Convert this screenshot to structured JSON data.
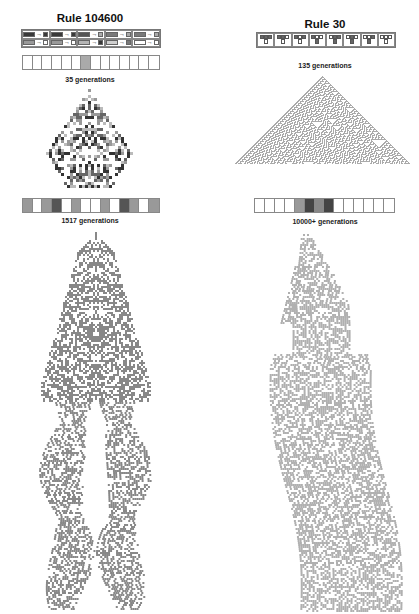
{
  "figure": {
    "left": {
      "title": "Rule 104600",
      "rule_icons": [
        {
          "input": "#3a3a3a",
          "output": "#3a3a3a"
        },
        {
          "input": "#3a3a3a",
          "output": "#3a3a3a"
        },
        {
          "input": "#555555",
          "output": "#aaaaaa"
        },
        {
          "input": "#7a7a7a",
          "output": "#aaaaaa"
        },
        {
          "input": "#7a7a7a",
          "output": "#aaaaaa"
        },
        {
          "input": "#999999",
          "output": "#ffffff"
        },
        {
          "input": "#999999",
          "output": "#ffffff"
        },
        {
          "input": "#b5b5b5",
          "output": "#3a3a3a"
        },
        {
          "input": "#d0d0d0",
          "output": "#7a7a7a"
        },
        {
          "input": "#ffffff",
          "output": "#ffffff"
        }
      ],
      "initial_state_1": [
        "#fff",
        "#fff",
        "#fff",
        "#fff",
        "#fff",
        "#fff",
        "#aaa",
        "#fff",
        "#fff",
        "#fff",
        "#fff",
        "#fff",
        "#fff",
        "#fff"
      ],
      "caption_1": "35 generations",
      "initial_state_2": [
        "#999",
        "#fff",
        "#999",
        "#555",
        "#fff",
        "#999",
        "#fff",
        "#fff",
        "#999",
        "#fff",
        "#555",
        "#999",
        "#fff",
        "#999"
      ],
      "caption_2": "1517 generations"
    },
    "right": {
      "title": "Rule 30",
      "rule_icons": [
        {
          "neighborhood": [
            "#666",
            "#666",
            "#666"
          ],
          "output": "#fff"
        },
        {
          "neighborhood": [
            "#666",
            "#666",
            "#fff"
          ],
          "output": "#fff"
        },
        {
          "neighborhood": [
            "#666",
            "#fff",
            "#666"
          ],
          "output": "#fff"
        },
        {
          "neighborhood": [
            "#666",
            "#fff",
            "#fff"
          ],
          "output": "#666"
        },
        {
          "neighborhood": [
            "#fff",
            "#666",
            "#666"
          ],
          "output": "#666"
        },
        {
          "neighborhood": [
            "#fff",
            "#666",
            "#fff"
          ],
          "output": "#666"
        },
        {
          "neighborhood": [
            "#fff",
            "#fff",
            "#666"
          ],
          "output": "#666"
        },
        {
          "neighborhood": [
            "#fff",
            "#fff",
            "#fff"
          ],
          "output": "#fff"
        }
      ],
      "caption_1": "135 generations",
      "initial_state_2": [
        "#fff",
        "#fff",
        "#fff",
        "#fff",
        "#999",
        "#444",
        "#888",
        "#444",
        "#fff",
        "#fff",
        "#fff",
        "#fff",
        "#fff",
        "#fff"
      ],
      "caption_2": "10000+ generations"
    }
  }
}
